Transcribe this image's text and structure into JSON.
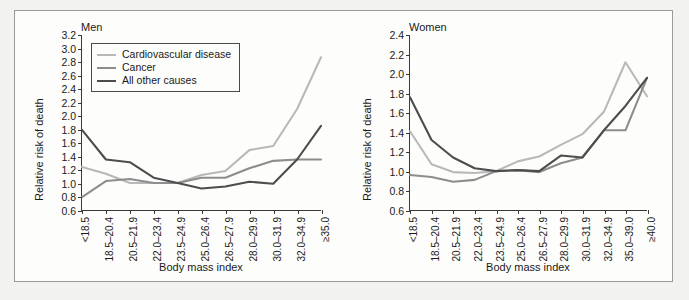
{
  "figure": {
    "xlabel": "Body mass index",
    "ylabel": "Relative risk of death",
    "legend": {
      "items": [
        {
          "label": "Cardiovascular disease",
          "color": "#b9b9b9"
        },
        {
          "label": "Cancer",
          "color": "#8d8d8d"
        },
        {
          "label": "All other causes",
          "color": "#4d4d4d"
        }
      ]
    }
  },
  "chart_data": [
    {
      "type": "line",
      "title": "Men",
      "xlabel": "Body mass index",
      "ylabel": "Relative risk of death",
      "ylim": [
        0.6,
        3.2
      ],
      "ytick_labels": [
        "3.2",
        "3.0",
        "2.8",
        "2.6",
        "2.4",
        "2.2",
        "2.0",
        "1.8",
        "1.6",
        "1.4",
        "1.2",
        "1.0",
        "0.8",
        "0.6"
      ],
      "yticks": [
        3.2,
        3.0,
        2.8,
        2.6,
        2.4,
        2.2,
        2.0,
        1.8,
        1.6,
        1.4,
        1.2,
        1.0,
        0.8,
        0.6
      ],
      "grid": false,
      "legend_position": "upper left",
      "categories": [
        "<18.5",
        "18.5–20.4",
        "20.5–21.9",
        "22.0–23.4",
        "23.5–24.9",
        "25.0–26.4",
        "26.5–27.9",
        "28.0–29.9",
        "30.0–31.9",
        "32.0–34.9",
        "≥35.0"
      ],
      "series": [
        {
          "name": "Cardiovascular disease",
          "color": "#b9b9b9",
          "values": [
            1.24,
            1.14,
            1.0,
            1.0,
            1.0,
            1.12,
            1.18,
            1.49,
            1.55,
            2.1,
            2.87
          ]
        },
        {
          "name": "Cancer",
          "color": "#8d8d8d",
          "values": [
            0.79,
            1.03,
            1.06,
            1.0,
            1.0,
            1.08,
            1.08,
            1.22,
            1.33,
            1.35,
            1.35
          ]
        },
        {
          "name": "All other causes",
          "color": "#4d4d4d",
          "values": [
            1.79,
            1.35,
            1.31,
            1.08,
            1.0,
            0.92,
            0.95,
            1.02,
            0.99,
            1.35,
            1.85
          ]
        }
      ]
    },
    {
      "type": "line",
      "title": "Women",
      "xlabel": "Body mass index",
      "ylabel": "Relative risk of death",
      "ylim": [
        0.6,
        2.4
      ],
      "ytick_labels": [
        "2.4",
        "2.2",
        "2.0",
        "1.8",
        "1.6",
        "1.4",
        "1.2",
        "1.0",
        "0.8",
        "0.6"
      ],
      "yticks": [
        2.4,
        2.2,
        2.0,
        1.8,
        1.6,
        1.4,
        1.2,
        1.0,
        0.8,
        0.6
      ],
      "grid": false,
      "legend_position": "none",
      "categories": [
        "<18.5",
        "18.5–20.4",
        "20.5–21.9",
        "22.0–23.4",
        "23.5–24.9",
        "25.0–26.4",
        "26.5–27.9",
        "28.0–29.9",
        "30.0–31.9",
        "32.0–34.9",
        "35.0–39.0",
        "≥40.0"
      ],
      "series": [
        {
          "name": "Cardiovascular disease",
          "color": "#b9b9b9",
          "values": [
            1.41,
            1.07,
            0.99,
            0.98,
            1.0,
            1.1,
            1.15,
            1.27,
            1.38,
            1.61,
            2.12,
            1.77
          ]
        },
        {
          "name": "Cancer",
          "color": "#8d8d8d",
          "values": [
            0.96,
            0.94,
            0.89,
            0.91,
            1.0,
            1.01,
            0.99,
            1.08,
            1.14,
            1.42,
            1.42,
            1.96
          ]
        },
        {
          "name": "All other causes",
          "color": "#4d4d4d",
          "values": [
            1.76,
            1.32,
            1.14,
            1.03,
            1.0,
            1.01,
            1.0,
            1.16,
            1.14,
            1.42,
            1.67,
            1.96
          ]
        }
      ]
    }
  ]
}
